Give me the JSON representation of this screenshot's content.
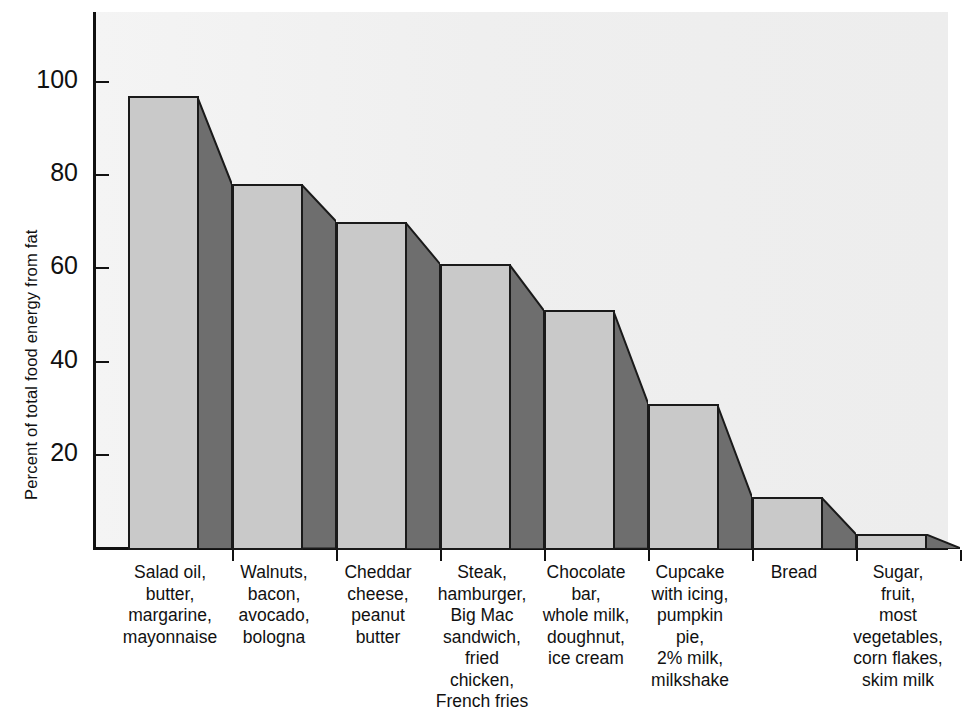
{
  "chart_data": {
    "type": "bar",
    "title": "",
    "subtitle": "",
    "xlabel": "",
    "ylabel": "Percent of total food energy from fat",
    "ylim": [
      0,
      115
    ],
    "grid": false,
    "legend": null,
    "y_ticks": [
      20,
      40,
      60,
      80,
      100
    ],
    "y_tick_labels": [
      "20",
      "40",
      "60",
      "80",
      "100"
    ],
    "categories": [
      "Salad oil,\nbutter,\nmargarine,\nmayonnaise",
      "Walnuts,\nbacon,\navocado,\nbologna",
      "Cheddar\ncheese,\npeanut\nbutter",
      "Steak,\nhamburger,\nBig Mac\nsandwich,\nfried\nchicken,\nFrench fries",
      "Chocolate\nbar,\nwhole milk,\ndoughnut,\nice cream",
      "Cupcake\nwith icing,\npumpkin\npie,\n2% milk,\nmilkshake",
      "Bread",
      "Sugar,\nfruit,\nmost\nvegetables,\ncorn flakes,\nskim milk"
    ],
    "values": [
      97,
      78,
      70,
      61,
      51,
      31,
      11,
      3
    ]
  },
  "style": {
    "bar_front_color": "#c9c9c9",
    "bar_side_color": "#6e6e6e",
    "outline_color": "#1a1a1a",
    "plot_background": "#efefef",
    "page_background": "#ffffff",
    "text_color": "#111111"
  }
}
